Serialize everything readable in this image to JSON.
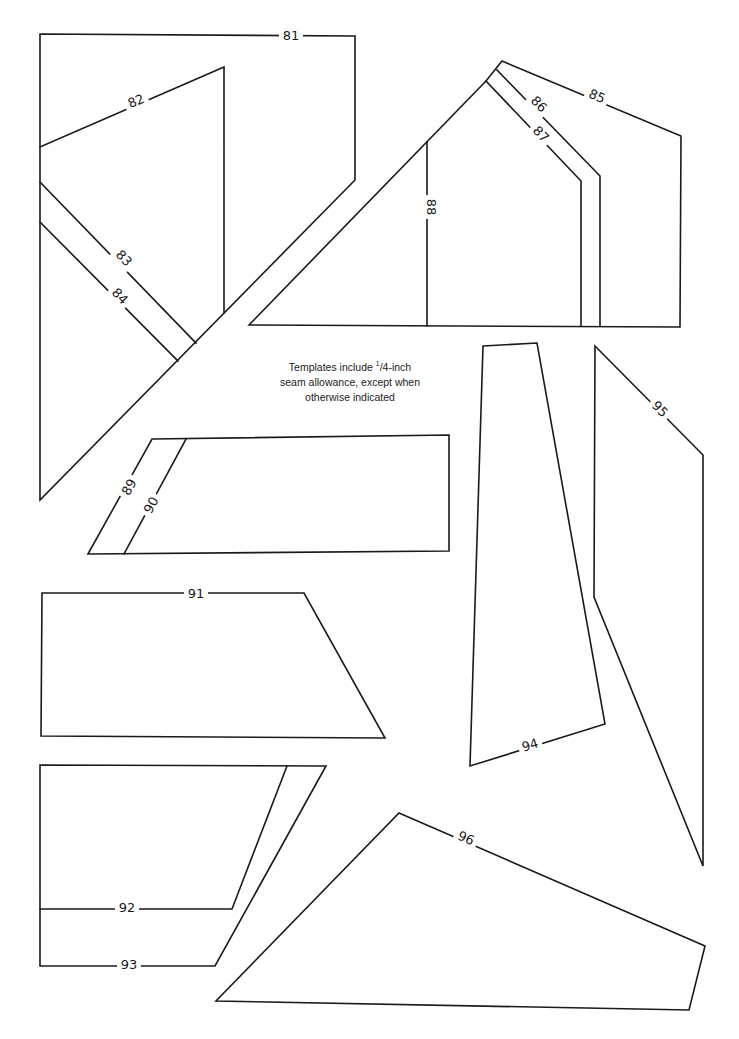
{
  "page": {
    "note": {
      "line1_prefix": "Templates include ",
      "fraction_num": "1",
      "fraction_den": "/4",
      "line1_suffix": "-inch",
      "line2": "seam allowance, except when",
      "line3": "otherwise indicated"
    }
  },
  "templates": [
    {
      "id": "81",
      "label": "81"
    },
    {
      "id": "82",
      "label": "82"
    },
    {
      "id": "83",
      "label": "83"
    },
    {
      "id": "84",
      "label": "84"
    },
    {
      "id": "85",
      "label": "85"
    },
    {
      "id": "86",
      "label": "86"
    },
    {
      "id": "87",
      "label": "87"
    },
    {
      "id": "88",
      "label": "88"
    },
    {
      "id": "89",
      "label": "89"
    },
    {
      "id": "90",
      "label": "90"
    },
    {
      "id": "91",
      "label": "91"
    },
    {
      "id": "92",
      "label": "92"
    },
    {
      "id": "93",
      "label": "93"
    },
    {
      "id": "94",
      "label": "94"
    },
    {
      "id": "95",
      "label": "95"
    },
    {
      "id": "96",
      "label": "96"
    }
  ]
}
